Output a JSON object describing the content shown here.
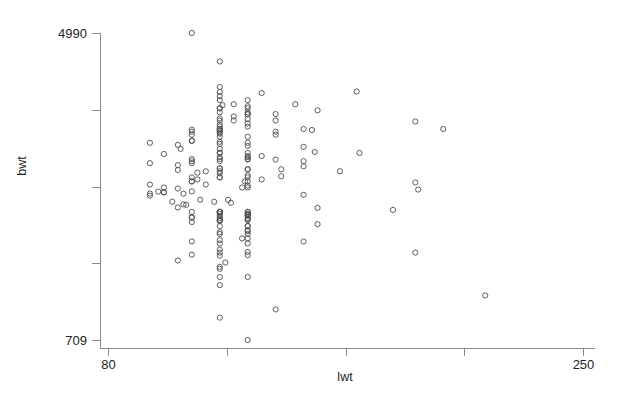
{
  "figure": {
    "kind": "scatter-plot",
    "background": "#ffffff",
    "axis_color": "#8c8c8c",
    "point_color": "#4d4d4d",
    "text_color": "#231f20",
    "point_radius": 2.6
  },
  "chart_data": {
    "type": "scatter",
    "title": "",
    "subtitle": "",
    "xlabel": "lwt",
    "ylabel": "bwt",
    "xlim": [
      80,
      250
    ],
    "ylim": [
      709,
      4990
    ],
    "grid": false,
    "legend": null,
    "x_ticks": [
      80,
      122.5,
      165,
      207.5,
      250
    ],
    "x_tick_labels": [
      "80",
      "",
      "",
      "",
      "250"
    ],
    "y_ticks": [
      709,
      1779,
      2849.5,
      3920,
      4990
    ],
    "y_tick_labels": [
      "709",
      "",
      "",
      "",
      "4990"
    ],
    "marker": "open-circle",
    "n_points": 189,
    "x": [
      182,
      155,
      105,
      108,
      107,
      124,
      118,
      103,
      123,
      113,
      95,
      150,
      95,
      107,
      100,
      100,
      98,
      110,
      191,
      105,
      100,
      130,
      128,
      130,
      95,
      115,
      190,
      110,
      110,
      129,
      130,
      112,
      135,
      120,
      110,
      130,
      120,
      142,
      130,
      120,
      112,
      163,
      115,
      120,
      105,
      130,
      142,
      130,
      120,
      120,
      150,
      105,
      110,
      95,
      120,
      150,
      110,
      130,
      140,
      120,
      130,
      110,
      120,
      130,
      135,
      130,
      100,
      170,
      120,
      130,
      120,
      154,
      120,
      106,
      150,
      130,
      105,
      120,
      95,
      130,
      120,
      130,
      110,
      110,
      120,
      140,
      110,
      120,
      120,
      110,
      140,
      120,
      120,
      153,
      110,
      120,
      150,
      200,
      120,
      120,
      130,
      120,
      130,
      190,
      120,
      140,
      125,
      130,
      120,
      125,
      130,
      130,
      140,
      120,
      130,
      155,
      120,
      120,
      130,
      130,
      121,
      147,
      125,
      120,
      130,
      120,
      135,
      120,
      169,
      120,
      120,
      110,
      130,
      120,
      140,
      215,
      120,
      120,
      130,
      120,
      120,
      122,
      105,
      120,
      130,
      110,
      190,
      120,
      130,
      120,
      120,
      130,
      150,
      110,
      120,
      128,
      130,
      130,
      120,
      120,
      130,
      130,
      130,
      120,
      130,
      155,
      110,
      120,
      120,
      130,
      120,
      130,
      130,
      120,
      110,
      110,
      120,
      130,
      130,
      130,
      120,
      130,
      120,
      130,
      120,
      120,
      110,
      130,
      120,
      130,
      120
    ],
    "y": [
      2523,
      2551,
      2557,
      2594,
      2600,
      2622,
      2637,
      2637,
      2663,
      2665,
      2722,
      2733,
      2751,
      2750,
      2769,
      2769,
      2778,
      2782,
      2807,
      2821,
      2835,
      2835,
      2836,
      2863,
      2877,
      2877,
      2906,
      2920,
      2920,
      2920,
      2920,
      2948,
      2948,
      2977,
      2977,
      2977,
      2977,
      2992,
      3005,
      3033,
      3042,
      3062,
      3062,
      3062,
      3080,
      3090,
      3090,
      3090,
      3100,
      3104,
      3132,
      3147,
      3175,
      3175,
      3203,
      3203,
      3203,
      3225,
      3225,
      3232,
      3232,
      3234,
      3260,
      3260,
      3274,
      3274,
      3303,
      3317,
      3317,
      3317,
      3321,
      3331,
      3374,
      3374,
      3402,
      3416,
      3430,
      3444,
      3459,
      3460,
      3473,
      3544,
      3487,
      3487,
      3544,
      3572,
      3572,
      3586,
      3600,
      3614,
      3614,
      3629,
      3629,
      3637,
      3643,
      3651,
      3651,
      3651,
      3651,
      3686,
      3686,
      3714,
      3728,
      3756,
      3770,
      3770,
      3770,
      3790,
      3799,
      3827,
      3856,
      3860,
      3860,
      3884,
      3884,
      3912,
      3940,
      3941,
      3941,
      3969,
      3983,
      3997,
      3997,
      4054,
      4054,
      4111,
      4153,
      4167,
      4174,
      4238,
      4593,
      4990,
      709,
      1021,
      1135,
      1330,
      1474,
      1588,
      1588,
      1701,
      1729,
      1790,
      1818,
      1885,
      1893,
      1899,
      1928,
      1928,
      1936,
      1970,
      2055,
      2055,
      2082,
      2084,
      2100,
      2125,
      2126,
      2187,
      2187,
      2211,
      2225,
      2240,
      2296,
      2296,
      2301,
      2325,
      2353,
      2367,
      2381,
      2381,
      2381,
      2395,
      2410,
      2410,
      2414,
      2424,
      2438,
      2442,
      2450,
      2466,
      2466,
      2466,
      2495,
      2495,
      2495,
      2495,
      2495,
      2495,
      2495
    ]
  }
}
